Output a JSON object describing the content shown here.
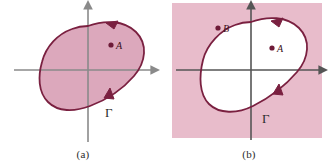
{
  "figure": {
    "width": 332,
    "height": 162,
    "background": "#ffffff"
  },
  "colors": {
    "curve_stroke": "#7a2040",
    "region_fill": "#dca8bc",
    "panel_b_background": "#e8bccb",
    "panel_b_interior": "#ffffff",
    "axis": "#8a8a8a",
    "point_marker": "#6e1b38",
    "caption_text": "#2b2b2b"
  },
  "panels": [
    {
      "id": "a",
      "caption": "(a)",
      "curve_label": "Γ",
      "fill_mode": "interior-shaded",
      "axes": {
        "x_axis": true,
        "y_axis": true,
        "origin_x": 88,
        "origin_y": 70,
        "x_arrow": true,
        "y_arrow": true
      },
      "points": [
        {
          "label": "A",
          "x": 111,
          "y": 45,
          "inside_curve": true
        }
      ],
      "orientation_arrows": [
        {
          "position": "upper-right",
          "direction": "counterclockwise"
        },
        {
          "position": "lower-right",
          "direction": "counterclockwise"
        }
      ],
      "gamma_position": {
        "x": 105,
        "y": 112
      }
    },
    {
      "id": "b",
      "caption": "(b)",
      "curve_label": "Γ",
      "fill_mode": "exterior-shaded",
      "axes": {
        "x_axis": true,
        "y_axis": true,
        "origin_x": 85,
        "origin_y": 70,
        "x_arrow": true,
        "y_arrow": true
      },
      "points": [
        {
          "label": "B",
          "x": 52,
          "y": 28,
          "inside_curve": false
        },
        {
          "label": "A",
          "x": 106,
          "y": 48,
          "inside_curve": true
        }
      ],
      "orientation_arrows": [
        {
          "position": "upper-right",
          "direction": "counterclockwise"
        },
        {
          "position": "lower-right",
          "direction": "counterclockwise"
        }
      ],
      "gamma_position": {
        "x": 96,
        "y": 118
      },
      "shaded_rect": {
        "x": 6,
        "y": 3,
        "width": 150,
        "height": 135
      }
    }
  ]
}
